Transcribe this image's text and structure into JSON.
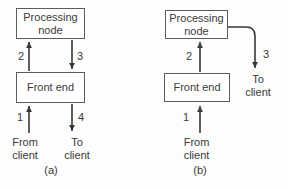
{
  "colors": {
    "background": "#fdfdfd",
    "line": "#383838",
    "box_border": "#5c5c5c",
    "box_fill": "#ffffff",
    "text": "#3a3a3a"
  },
  "diagram_a": {
    "caption": "(a)",
    "processing_node": "Processing node",
    "front_end": "Front end",
    "from_client": "From client",
    "to_client": "To client",
    "arrow_labels": {
      "client_to_front_end": "1",
      "front_end_to_processing": "2",
      "processing_to_front_end": "3",
      "front_end_to_client": "4"
    }
  },
  "diagram_b": {
    "caption": "(b)",
    "processing_node": "Processing node",
    "front_end": "Front end",
    "from_client": "From client",
    "to_client": "To client",
    "arrow_labels": {
      "client_to_front_end": "1",
      "front_end_to_processing": "2",
      "processing_to_client": "3"
    }
  }
}
